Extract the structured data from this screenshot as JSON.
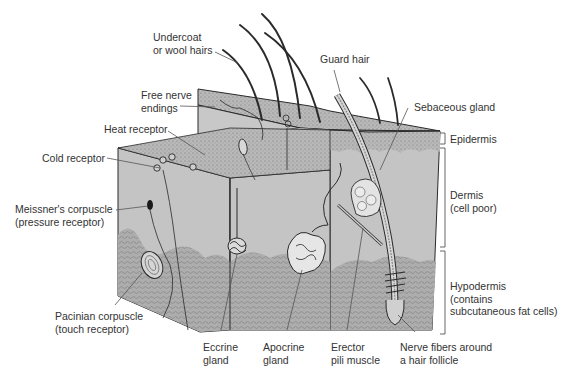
{
  "diagram": {
    "type": "anatomical-cross-section",
    "colors": {
      "dermis_fill": "#c4c4c4",
      "epidermis_fill": "#b5b5b5",
      "hypodermis_fill": "#a9a9a9",
      "outline": "#2a2a2a",
      "label_text": "#333333",
      "leader_line": "#555555"
    }
  },
  "labels": {
    "undercoat": "Undercoat\nor wool hairs",
    "free_nerve": "Free nerve\nendings",
    "heat_receptor": "Heat receptor",
    "cold_receptor": "Cold receptor",
    "meissner": "Meissner's corpuscle\n(pressure receptor)",
    "pacinian": "Pacinian corpuscle\n(touch receptor)",
    "eccrine": "Eccrine\ngland",
    "apocrine": "Apocrine\ngland",
    "erector": "Erector\npili muscle",
    "nerve_fibers": "Nerve fibers around\na hair follicle",
    "guard_hair": "Guard hair",
    "sebaceous": "Sebaceous gland"
  },
  "layers": {
    "epidermis": "Epidermis",
    "dermis": "Dermis\n(cell poor)",
    "hypodermis": "Hypodermis\n(contains\nsubcutaneous fat cells)"
  }
}
